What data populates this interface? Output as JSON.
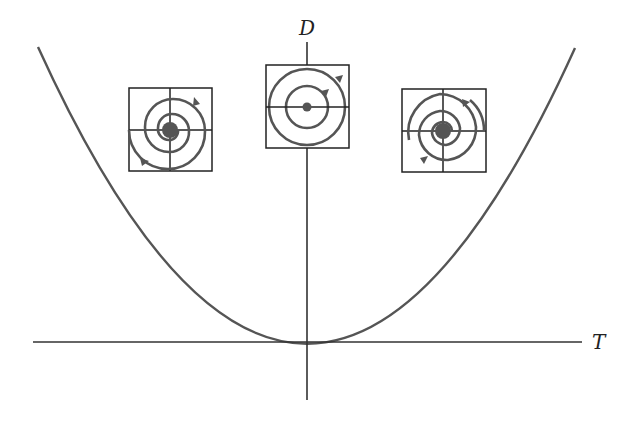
{
  "diagram": {
    "type": "trace-determinant plane",
    "axes": {
      "horizontal_label": "T",
      "vertical_label": "D"
    },
    "curve": "parabola T^2 - 4D = 0",
    "colors": {
      "axis": "#333333",
      "curve": "#555555",
      "spiral": "#555555",
      "equilibrium": "#555555",
      "box": "#222222"
    },
    "phase_portraits": [
      {
        "name": "spiral-sink",
        "position": "left",
        "description": "spiral sink (T<0)",
        "direction": "clockwise-inward"
      },
      {
        "name": "center",
        "position": "middle",
        "description": "center (T=0)",
        "direction": "clockwise-closed-orbits"
      },
      {
        "name": "spiral-source",
        "position": "right",
        "description": "spiral source (T>0)",
        "direction": "clockwise-outward"
      }
    ]
  }
}
